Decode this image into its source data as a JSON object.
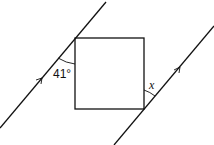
{
  "diagram": {
    "type": "geometry",
    "angle_label": "41°",
    "unknown_label": "x",
    "colors": {
      "stroke": "#111111",
      "background": "#ffffff"
    }
  }
}
